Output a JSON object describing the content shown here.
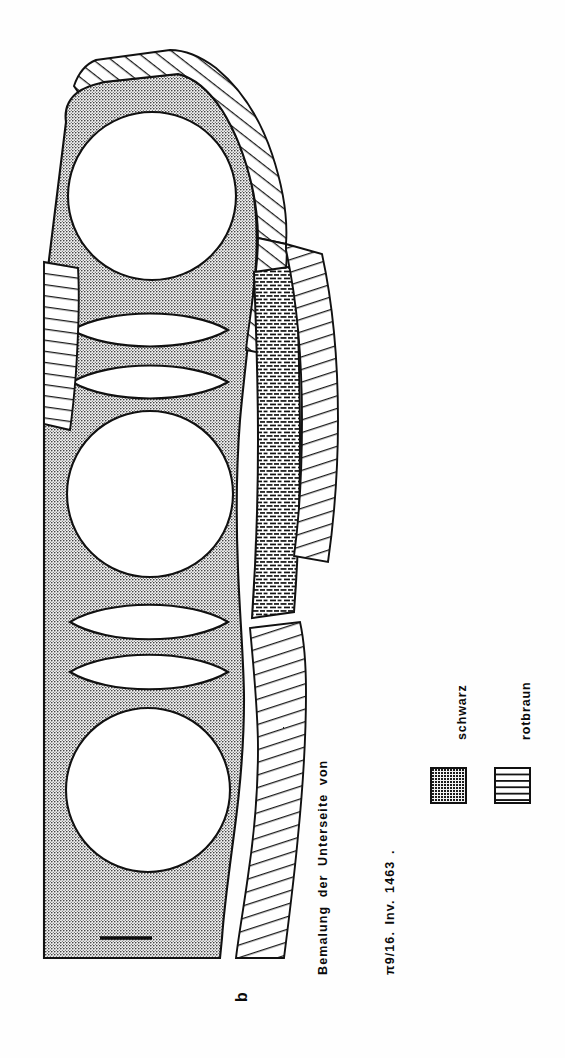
{
  "figure": {
    "label": "b",
    "caption_line_1": "Bemalung  der  Unterseite  von",
    "caption_line_2": "π9/16.  Inv. 1463 .",
    "text_orientation": "rotated-90-counterclockwise"
  },
  "legend": {
    "entries": [
      {
        "label": "schwarz",
        "swatch": "stippled-dotted",
        "color": "#1a1a1a"
      },
      {
        "label": "rotbraun",
        "swatch": "dashed-brick-lines",
        "color": "#141414"
      }
    ]
  },
  "drawing": {
    "description": "Elongated vessel fragment with painted underside decoration",
    "ground_fill": "stippled",
    "ground_color": "#f2f2f2",
    "stipple_dot_color": "#1a1a1a",
    "outline_color": "#111111",
    "motifs": {
      "circles": [
        {
          "cx": 152,
          "cy": 196,
          "r": 84
        },
        {
          "cx": 150,
          "cy": 494,
          "r": 83
        },
        {
          "cx": 148,
          "cy": 790,
          "r": 82
        }
      ],
      "lens_shapes": [
        {
          "cx": 150,
          "cy": 330,
          "rx": 78,
          "ry": 19
        },
        {
          "cx": 150,
          "cy": 382,
          "rx": 78,
          "ry": 19
        },
        {
          "cx": 149,
          "cy": 622,
          "rx": 78,
          "ry": 20
        },
        {
          "cx": 149,
          "cy": 672,
          "rx": 78,
          "ry": 20
        }
      ]
    },
    "scale_bar": {
      "x1": 100,
      "y1": 938,
      "x2": 152,
      "y2": 938
    },
    "hatched_bands": "ladder-hatching-break-edges",
    "rotbraun_band": "vertical-dashed-band-right-side"
  },
  "colors": {
    "ink": "#111111",
    "paper": "#ffffff",
    "stipple_ground": "#f2f2f2",
    "text": "#0a0a0a"
  }
}
